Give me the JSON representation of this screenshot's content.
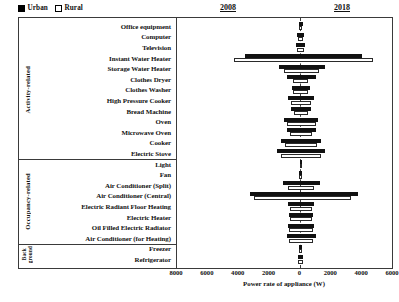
{
  "legend": {
    "items": [
      {
        "label": "Urban",
        "swatch": "filled-square-icon",
        "color": "#000000"
      },
      {
        "label": "Rural",
        "swatch": "empty-square-icon",
        "color": "#ffffff"
      }
    ]
  },
  "panels": [
    {
      "id": "left",
      "title": "2008"
    },
    {
      "id": "right",
      "title": "2018"
    }
  ],
  "groups": [
    {
      "label": "Activity-related",
      "rows": 13
    },
    {
      "label": "Occupancy-related",
      "rows": 8
    },
    {
      "label": "Back ground",
      "rows": 2
    }
  ],
  "axis": {
    "title": "Power rate of appliance (W)",
    "ticks": [
      "8000",
      "6000",
      "4000",
      "2000",
      "0",
      "2000",
      "4000",
      "6000"
    ],
    "tick_values": [
      -8000,
      -6000,
      -4000,
      -2000,
      0,
      2000,
      4000,
      6000
    ],
    "min": -8000,
    "max": 6000
  },
  "chart_data": {
    "type": "bar",
    "orientation": "horizontal",
    "style": "mirrored-butterfly",
    "title": "",
    "subtitle": "",
    "xlabel": "Power rate of appliance (W)",
    "ylabel": "",
    "xlim": [
      -8000,
      6000
    ],
    "grid": false,
    "legend_position": "top-left",
    "legend": [
      "Urban",
      "Rural"
    ],
    "panels": [
      "2008",
      "2018"
    ],
    "note": "Left half of each row = 2008 (plotted as negative magnitude), right half = 2018. Each category has an Urban (black) bar above a Rural (white) bar.",
    "categories": [
      "Office equipment",
      "Computer",
      "Television",
      "Instant Water Heater",
      "Storage Water Heater",
      "Clothes Dryer",
      "Clothes Washer",
      "High Pressure Cooker",
      "Bread Machine",
      "Oven",
      "Microwave Oven",
      "Cooker",
      "Electric Stove",
      "Light",
      "Fan",
      "Air Conditioner (Split)",
      "Air Conditioner (Central)",
      "Electric Radiant Floor Heating",
      "Electric Heater",
      "Oil Filled Electric Radiator",
      "Air Conditioner (for Heating)",
      "Freezer",
      "Refrigerator"
    ],
    "groups": [
      "Activity-related",
      "Activity-related",
      "Activity-related",
      "Activity-related",
      "Activity-related",
      "Activity-related",
      "Activity-related",
      "Activity-related",
      "Activity-related",
      "Activity-related",
      "Activity-related",
      "Activity-related",
      "Activity-related",
      "Occupancy-related",
      "Occupancy-related",
      "Occupancy-related",
      "Occupancy-related",
      "Occupancy-related",
      "Occupancy-related",
      "Occupancy-related",
      "Occupancy-related",
      "Back ground",
      "Back ground"
    ],
    "series": [
      {
        "name": "Urban 2008",
        "panel": "2008",
        "group": "Urban",
        "values": [
          120,
          200,
          260,
          3600,
          1400,
          900,
          560,
          800,
          620,
          1050,
          900,
          1250,
          1500,
          60,
          90,
          1150,
          3300,
          820,
          760,
          820,
          900,
          110,
          150
        ]
      },
      {
        "name": "Rural 2008",
        "panel": "2008",
        "group": "Rural",
        "values": [
          90,
          150,
          200,
          4300,
          1050,
          450,
          480,
          640,
          420,
          900,
          700,
          1000,
          1250,
          50,
          80,
          800,
          3000,
          700,
          700,
          760,
          760,
          90,
          130
        ]
      },
      {
        "name": "Urban 2018",
        "panel": "2018",
        "group": "Urban",
        "values": [
          140,
          220,
          280,
          4000,
          1600,
          1000,
          600,
          880,
          700,
          1150,
          980,
          1350,
          1600,
          70,
          110,
          1250,
          3700,
          900,
          840,
          900,
          980,
          130,
          170
        ]
      },
      {
        "name": "Rural 2018",
        "panel": "2018",
        "group": "Rural",
        "values": [
          110,
          170,
          230,
          4700,
          1200,
          520,
          520,
          700,
          500,
          980,
          780,
          1100,
          1350,
          60,
          95,
          900,
          3300,
          780,
          760,
          840,
          840,
          100,
          150
        ]
      }
    ]
  }
}
